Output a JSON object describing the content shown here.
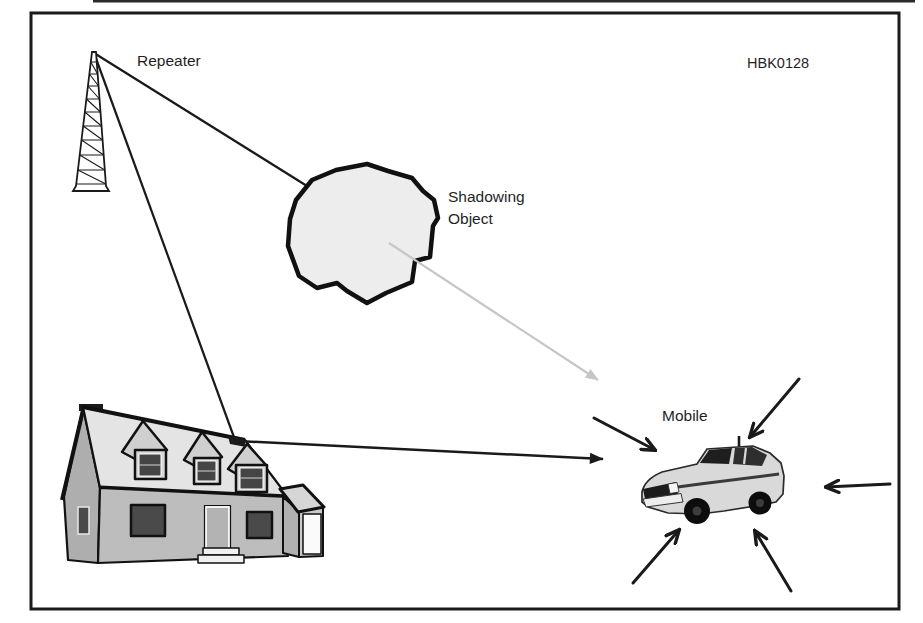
{
  "figure": {
    "code": "HBK0128",
    "labels": {
      "repeater": "Repeater",
      "shadowing_object_line1": "Shadowing",
      "shadowing_object_line2": "Object",
      "mobile": "Mobile"
    },
    "colors": {
      "ink": "#1a1a1a",
      "shadow_arrow": "#c6c6c6",
      "blob_fill": "#ededed",
      "roof_fill": "#e4e4e4",
      "front_wall_fill": "#bdbdbd",
      "side_wall_fill": "#aeaeae",
      "window_fill": "#4a4a4a",
      "car_body_fill": "#d9d9d9"
    }
  }
}
